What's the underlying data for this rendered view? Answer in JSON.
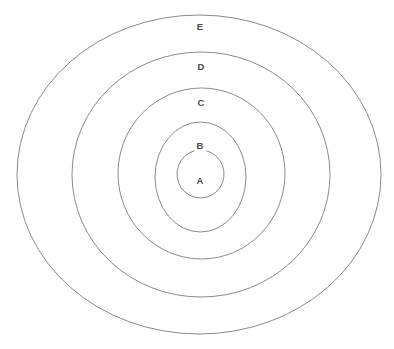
{
  "diagram": {
    "type": "concentric-rings",
    "title": "",
    "background_color": "#ffffff",
    "stroke_color": "#8a8a8a",
    "label_color": "#4a4a4a",
    "canvas": {
      "width": 394,
      "height": 349
    },
    "rings": [
      {
        "id": "A",
        "label": "A",
        "level": 1,
        "cx": 200.5,
        "cy": 174.0,
        "rx": 23.5,
        "ry": 24.0,
        "label_x": 200,
        "label_y": 181,
        "broken_top": true,
        "gap_start_deg": 255,
        "gap_end_deg": 285
      },
      {
        "id": "B",
        "label": "B",
        "level": 2,
        "cx": 200.5,
        "cy": 177.0,
        "rx": 45.5,
        "ry": 55.0,
        "label_x": 200,
        "label_y": 146,
        "broken_top": false
      },
      {
        "id": "C",
        "label": "C",
        "level": 3,
        "cx": 201.5,
        "cy": 173.5,
        "rx": 83.5,
        "ry": 85.5,
        "label_x": 201,
        "label_y": 103,
        "broken_top": false
      },
      {
        "id": "D",
        "label": "D",
        "level": 4,
        "cx": 201.0,
        "cy": 174.5,
        "rx": 129.0,
        "ry": 122.5,
        "label_x": 201,
        "label_y": 67,
        "broken_top": false
      },
      {
        "id": "E",
        "label": "E",
        "level": 5,
        "cx": 199.0,
        "cy": 174.5,
        "rx": 182.0,
        "ry": 159.5,
        "label_x": 200,
        "label_y": 27,
        "broken_top": false
      }
    ]
  },
  "chart_data": {
    "type": "diagram",
    "subtype": "nested-concentric-rings",
    "title": "",
    "categories": [
      "A",
      "B",
      "C",
      "D",
      "E"
    ],
    "values": [
      24,
      55,
      85.5,
      122.5,
      159.5
    ],
    "ylabel": "ring radius (px)",
    "xlabel": "ring label",
    "legend": []
  }
}
